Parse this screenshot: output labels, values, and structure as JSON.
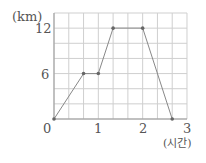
{
  "chart_data": {
    "type": "line",
    "title": "",
    "xlabel": "(시간)",
    "ylabel": "(km)",
    "x": [
      0,
      0.6667,
      1,
      1.3333,
      2,
      2.6667
    ],
    "series": [
      {
        "name": "distance",
        "values": [
          0,
          6,
          6,
          12,
          12,
          0
        ]
      }
    ],
    "x_ticks": [
      "0",
      "1",
      "2",
      "3"
    ],
    "y_ticks": [
      "6",
      "12"
    ],
    "xlim": [
      0,
      3
    ],
    "ylim": [
      0,
      14
    ],
    "grid": true,
    "grid_x_step": 0.3333,
    "grid_y_step": 2,
    "colors": {
      "line": "#888888",
      "grid": "#cfcfcf",
      "marker": "#666666"
    }
  },
  "labels": {
    "y_unit": "(km)",
    "x_unit": "(시간)",
    "origin": "0",
    "y6": "6",
    "y12": "12",
    "x1": "1",
    "x2": "2",
    "x3": "3"
  }
}
